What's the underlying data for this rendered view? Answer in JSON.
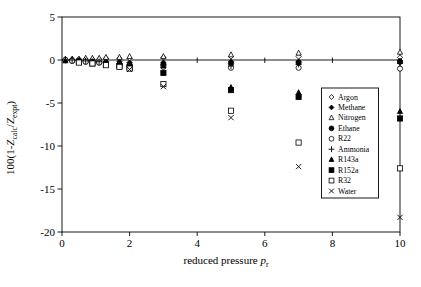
{
  "chart_data": {
    "type": "scatter",
    "title": "",
    "xlabel_parts": [
      {
        "t": "reduced pressure "
      },
      {
        "t": "p",
        "italic": true
      },
      {
        "t": "r",
        "sub": true
      }
    ],
    "ylabel_parts": [
      {
        "t": "100(1-"
      },
      {
        "t": "Z",
        "italic": true
      },
      {
        "t": "calc",
        "sub": true
      },
      {
        "t": "/"
      },
      {
        "t": "Z",
        "italic": true
      },
      {
        "t": "expt",
        "sub": true
      },
      {
        "t": ")"
      }
    ],
    "xlim": [
      0,
      10
    ],
    "ylim": [
      -20,
      5
    ],
    "xticks": [
      0,
      2,
      4,
      6,
      8,
      10
    ],
    "yticks": [
      5,
      0,
      -5,
      -10,
      -15,
      -20
    ],
    "grid": false,
    "legend_position": "inside-right",
    "axis_color": "#000000",
    "marker_color": "#000000",
    "series": [
      {
        "name": "Argon",
        "marker": "diamond",
        "fill": "open",
        "points": [
          [
            0.1,
            0.0
          ],
          [
            0.3,
            0.1
          ],
          [
            0.5,
            0.1
          ],
          [
            0.7,
            0.1
          ],
          [
            0.9,
            0.1
          ],
          [
            1.1,
            0.1
          ],
          [
            1.3,
            0.2
          ],
          [
            1.7,
            0.2
          ],
          [
            2,
            0.2
          ],
          [
            3,
            0.3
          ],
          [
            5,
            0.4
          ],
          [
            7,
            0.4
          ],
          [
            10,
            0.3
          ]
        ]
      },
      {
        "name": "Methane",
        "marker": "diamond",
        "fill": "filled",
        "points": [
          [
            0.1,
            0.0
          ],
          [
            0.3,
            0.0
          ],
          [
            0.5,
            -0.1
          ],
          [
            0.7,
            -0.1
          ],
          [
            0.9,
            -0.1
          ],
          [
            1.1,
            -0.2
          ],
          [
            1.3,
            -0.2
          ],
          [
            1.7,
            -0.2
          ],
          [
            2,
            -0.3
          ],
          [
            3,
            -0.3
          ],
          [
            5,
            -0.2
          ],
          [
            7,
            -0.2
          ],
          [
            10,
            -0.1
          ]
        ]
      },
      {
        "name": "Nitrogen",
        "marker": "triangle",
        "fill": "open",
        "points": [
          [
            0.1,
            0.1
          ],
          [
            0.3,
            0.1
          ],
          [
            0.5,
            0.1
          ],
          [
            0.7,
            0.2
          ],
          [
            0.9,
            0.2
          ],
          [
            1.1,
            0.2
          ],
          [
            1.3,
            0.3
          ],
          [
            1.7,
            0.3
          ],
          [
            2,
            0.4
          ],
          [
            3,
            0.4
          ],
          [
            5,
            0.6
          ],
          [
            7,
            0.8
          ],
          [
            10,
            0.9
          ]
        ]
      },
      {
        "name": "Ethane",
        "marker": "circle",
        "fill": "filled",
        "points": [
          [
            0.1,
            0.0
          ],
          [
            0.3,
            -0.1
          ],
          [
            0.5,
            -0.1
          ],
          [
            0.7,
            -0.2
          ],
          [
            0.9,
            -0.2
          ],
          [
            1.1,
            -0.3
          ],
          [
            1.3,
            -0.4
          ],
          [
            1.7,
            -0.5
          ],
          [
            2,
            -0.6
          ],
          [
            3,
            -0.5
          ],
          [
            5,
            -0.4
          ],
          [
            7,
            -0.3
          ],
          [
            10,
            -0.2
          ]
        ]
      },
      {
        "name": "R22",
        "marker": "circle",
        "fill": "open",
        "points": [
          [
            0.1,
            0.0
          ],
          [
            0.3,
            -0.1
          ],
          [
            0.5,
            -0.2
          ],
          [
            0.7,
            -0.2
          ],
          [
            0.9,
            -0.3
          ],
          [
            1.1,
            -0.3
          ],
          [
            1.3,
            -0.4
          ],
          [
            1.7,
            -0.6
          ],
          [
            2,
            -0.7
          ],
          [
            3,
            -0.8
          ],
          [
            5,
            -0.9
          ],
          [
            7,
            -0.9
          ],
          [
            10,
            -1.0
          ]
        ]
      },
      {
        "name": "Ammonia",
        "marker": "plus",
        "fill": "line",
        "points": [
          [
            0.1,
            0.0
          ],
          [
            0.3,
            0.0
          ],
          [
            0.5,
            -0.1
          ],
          [
            0.7,
            -0.1
          ],
          [
            0.9,
            -0.2
          ],
          [
            1.1,
            -0.2
          ],
          [
            1.3,
            -0.3
          ],
          [
            1.7,
            -0.4
          ],
          [
            2,
            -0.5
          ],
          [
            3,
            -0.6
          ],
          [
            5,
            -0.7
          ],
          [
            7,
            -0.5
          ],
          [
            10,
            -0.4
          ]
        ]
      },
      {
        "name": "R143a",
        "marker": "triangle",
        "fill": "filled",
        "points": [
          [
            0.1,
            -0.1
          ],
          [
            0.5,
            -0.2
          ],
          [
            0.9,
            -0.3
          ],
          [
            1.3,
            -0.4
          ],
          [
            1.7,
            -0.6
          ],
          [
            2,
            -0.8
          ],
          [
            3,
            -0.7
          ],
          [
            5,
            -3.2
          ],
          [
            7,
            -3.8
          ],
          [
            10,
            -6.0
          ]
        ]
      },
      {
        "name": "R152a",
        "marker": "square",
        "fill": "filled",
        "points": [
          [
            0.5,
            -0.2
          ],
          [
            0.9,
            -0.4
          ],
          [
            1.3,
            -0.5
          ],
          [
            1.7,
            -0.7
          ],
          [
            2,
            -0.9
          ],
          [
            3,
            -1.5
          ],
          [
            5,
            -3.5
          ],
          [
            7,
            -4.3
          ],
          [
            10,
            -6.8
          ]
        ]
      },
      {
        "name": "R32",
        "marker": "square",
        "fill": "open",
        "points": [
          [
            0.5,
            -0.3
          ],
          [
            0.9,
            -0.4
          ],
          [
            1.3,
            -0.6
          ],
          [
            1.7,
            -0.8
          ],
          [
            2,
            -1.0
          ],
          [
            3,
            -2.8
          ],
          [
            5,
            -5.9
          ],
          [
            7,
            -9.6
          ],
          [
            10,
            -12.6
          ]
        ]
      },
      {
        "name": "Water",
        "marker": "x",
        "fill": "line",
        "points": [
          [
            2,
            -1.1
          ],
          [
            3,
            -3.1
          ],
          [
            5,
            -6.7
          ],
          [
            7,
            -12.4
          ],
          [
            10,
            -18.3
          ]
        ]
      }
    ]
  }
}
